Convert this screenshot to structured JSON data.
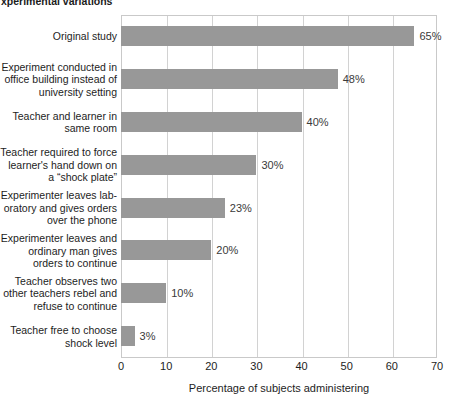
{
  "top_caption": {
    "left_fragment": "xperimental variations",
    "right_fragment": ""
  },
  "chart_data": {
    "type": "bar",
    "orientation": "horizontal",
    "title": "",
    "xlabel": "Percentage of subjects administering",
    "ylabel": "",
    "xlim": [
      0,
      70
    ],
    "xticks": [
      "0",
      "10",
      "20",
      "30",
      "40",
      "50",
      "60",
      "70"
    ],
    "grid": true,
    "legend": "none",
    "bar_color": "#989898",
    "grid_color": "#d2d2d2",
    "categories": [
      "Original study",
      "Experiment conducted in\noffice building instead of\nuniversity setting",
      "Teacher and learner in\nsame room",
      "Teacher required to force\nlearner's hand down on\na “shock plate”",
      "Experimenter leaves lab-\noratory and gives orders\nover the phone",
      "Experimenter leaves and\nordinary man gives\norders to continue",
      "Teacher observes two\nother teachers rebel and\nrefuse to continue",
      "Teacher free to choose\nshock level"
    ],
    "values": [
      65,
      48,
      40,
      30,
      23,
      20,
      10,
      3
    ],
    "value_labels": [
      "65%",
      "48%",
      "40%",
      "30%",
      "23%",
      "20%",
      "10%",
      "3%"
    ]
  }
}
